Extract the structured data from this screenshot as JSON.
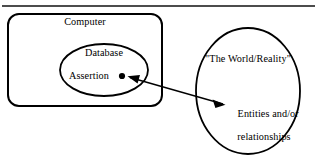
{
  "figure": {
    "background_color": "#ffffff",
    "stroke_color": "#000000",
    "text_color": "#000000",
    "top_rule": {
      "name": "horizontal-rule",
      "y": 6
    },
    "shapes": {
      "computer_box": {
        "label": "Computer",
        "kind": "rounded-rectangle",
        "x": 8,
        "y": 14,
        "width": 154,
        "height": 92,
        "corner_radius": 11
      },
      "database_ellipse": {
        "label": "Database",
        "kind": "ellipse",
        "cx": 104,
        "cy": 70,
        "rx": 44,
        "ry": 26
      },
      "world_ellipse": {
        "label": "\"The World/Reality\"",
        "kind": "ellipse",
        "cx": 248,
        "cy": 91,
        "rx": 52,
        "ry": 63
      }
    },
    "assertion": {
      "label": "Assertion",
      "dot": {
        "name": "assertion-dot",
        "cx": 122,
        "cy": 76,
        "r": 3
      }
    },
    "entities": {
      "line1": "Entities and/or",
      "line2": "relationships"
    },
    "connector": {
      "name": "assertion-to-entities-arrow",
      "kind": "double-headed-arrow",
      "from_x": 131,
      "from_y": 77,
      "to_x": 222,
      "to_y": 104
    }
  }
}
